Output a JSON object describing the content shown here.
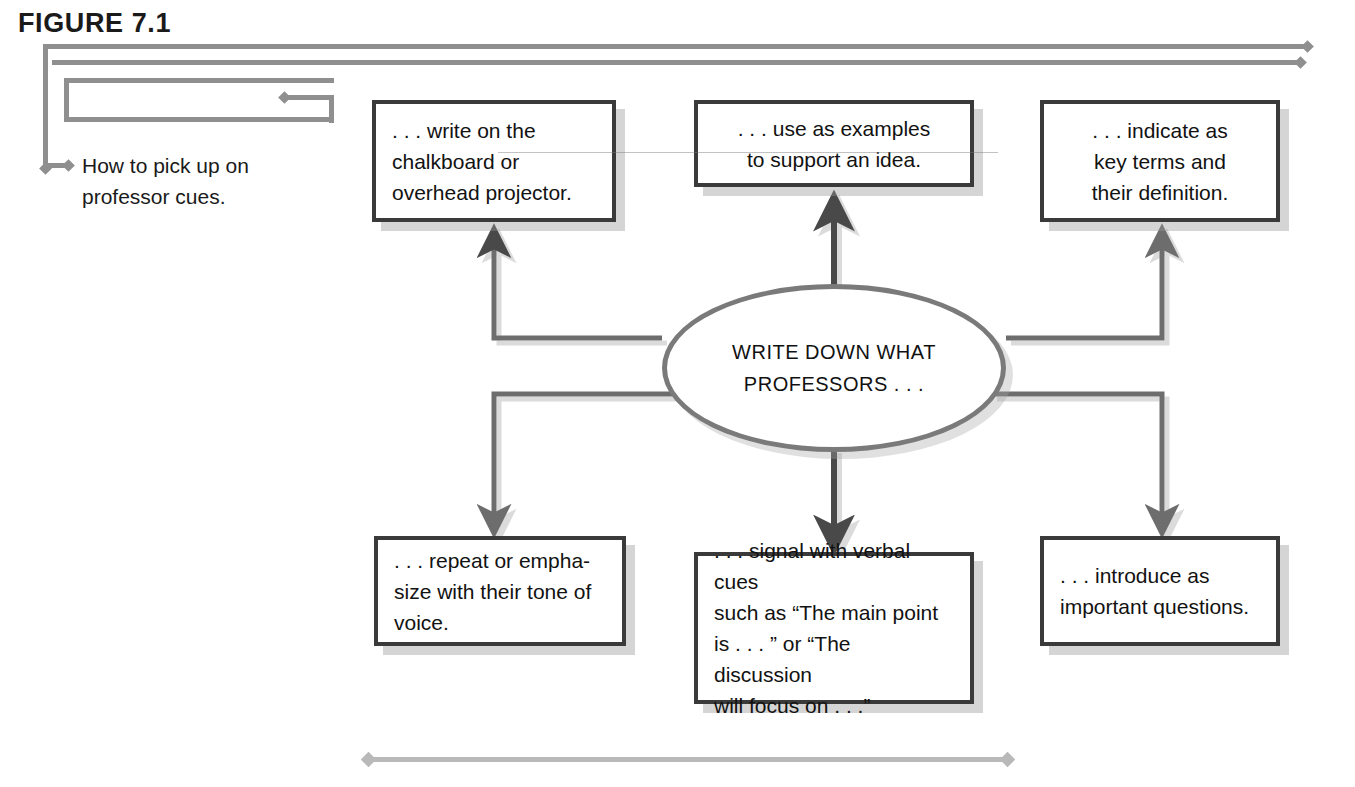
{
  "figure": {
    "label": "FIGURE 7.1",
    "caption": "How to pick up on professor cues."
  },
  "hub": {
    "line1": "WRITE DOWN WHAT",
    "line2": "PROFESSORS . . ."
  },
  "nodes": [
    {
      "id": "chalkboard",
      "position": "top-left",
      "text": ". . . write on the chalkboard or overhead projector."
    },
    {
      "id": "examples",
      "position": "top-center",
      "text": ". . . use as examples to support an idea."
    },
    {
      "id": "keyterms",
      "position": "top-right",
      "text": ". . . indicate as key terms and their definition."
    },
    {
      "id": "tone",
      "position": "bottom-left",
      "text": ". . . repeat or empha-size with their tone of voice."
    },
    {
      "id": "verbalcues",
      "position": "bottom-center",
      "text": ". . . signal with verbal cues such as “The main point is . . . ” or “The discussion will focus on . . .”"
    },
    {
      "id": "questions",
      "position": "bottom-right",
      "text": ". . . introduce as important questions."
    }
  ],
  "node_lines": {
    "chalkboard": [
      ". . . write on the",
      "chalkboard or",
      "overhead projector."
    ],
    "examples": [
      ". . . use as examples",
      "to support an idea."
    ],
    "keyterms": [
      ". . . indicate as",
      "key terms and",
      "their definition."
    ],
    "tone": [
      ". . . repeat or empha-",
      "size with their tone of",
      "voice."
    ],
    "verbalcues": [
      ". . . signal with verbal cues",
      "such as “The main point",
      "is . . . ” or “The discussion",
      "will focus on . . .”"
    ],
    "questions": [
      ". . . introduce as",
      "important questions."
    ]
  },
  "colors": {
    "frame_rule": "#8f8f8f",
    "bottom_rule": "#b9b9b9",
    "node_border": "#3a3a3a",
    "hub_border": "#7a7a7a",
    "connector": "#6d6d6d",
    "text": "#121212",
    "background": "#ffffff"
  }
}
